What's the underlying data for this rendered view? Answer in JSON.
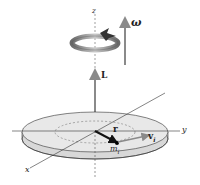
{
  "diagram": {
    "type": "rigid-body-rotation",
    "labels": {
      "z_axis": "z",
      "y_axis": "y",
      "x_axis": "x",
      "omega": "ω",
      "angular_momentum": "L",
      "position_vector": "r",
      "mass": "m",
      "mass_sub": "i",
      "velocity": "v",
      "velocity_sub": "i"
    },
    "colors": {
      "arrow_gray": "#8a8a8a",
      "disk_fill": "#e6e6e6",
      "disk_edge": "#d2d2d2",
      "line": "#333333",
      "r_vector": "#111111"
    }
  }
}
